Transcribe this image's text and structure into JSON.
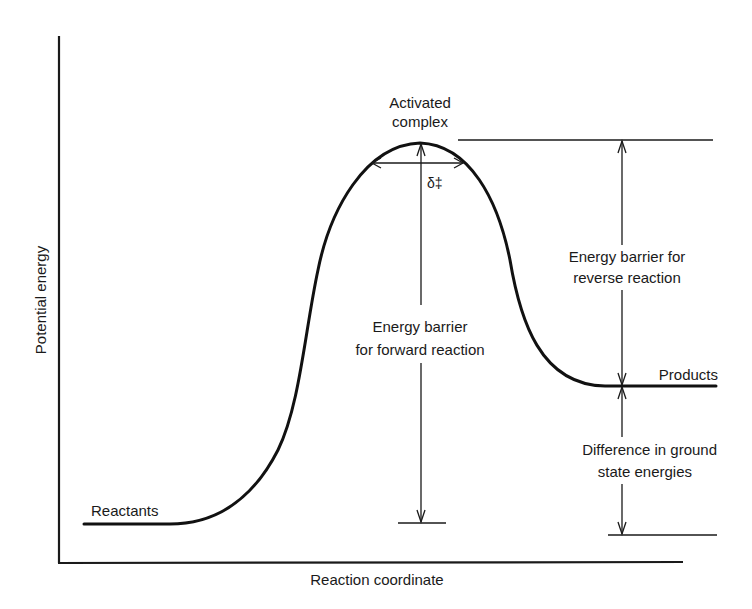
{
  "diagram": {
    "type": "reaction-energy-profile",
    "axes": {
      "y_label": "Potential energy",
      "x_label": "Reaction coordinate"
    },
    "labels": {
      "activated_complex_line1": "Activated",
      "activated_complex_line2": "complex",
      "delta_symbol": "δ‡",
      "reactants": "Reactants",
      "products": "Products",
      "forward_barrier_line1": "Energy barrier",
      "forward_barrier_line2": "for forward reaction",
      "reverse_barrier_line1": "Energy barrier for",
      "reverse_barrier_line2": "reverse reaction",
      "ground_state_line1": "Difference in ground",
      "ground_state_line2": "state energies"
    },
    "colors": {
      "ink": "#1a1a1a",
      "background": "#ffffff"
    }
  }
}
